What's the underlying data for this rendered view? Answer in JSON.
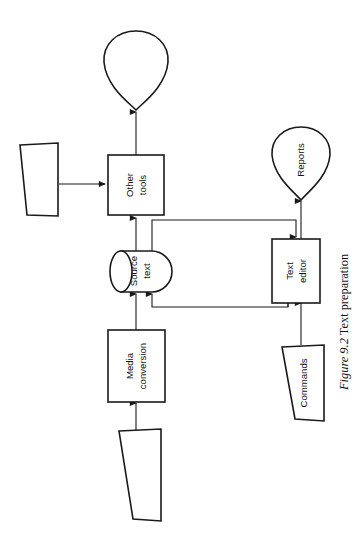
{
  "figure": {
    "caption_prefix": "Figure 9.2",
    "caption_text": "Text preparation",
    "rotation_degrees": -90,
    "background_color": "#ffffff",
    "line_color": "#1a1a1a"
  },
  "nodes": {
    "printed_output": {
      "label": "",
      "shape": "shield"
    },
    "other_tools": {
      "label_line1": "Other",
      "label_line2": "tools",
      "shape": "process-box"
    },
    "manual_input_tools": {
      "label": "",
      "shape": "trapezoid"
    },
    "source_text": {
      "label_line1": "Source",
      "label_line2": "text",
      "shape": "cylinder"
    },
    "media_conversion": {
      "label_line1": "Media",
      "label_line2": "conversion",
      "shape": "process-box"
    },
    "media_input": {
      "label": "",
      "shape": "trapezoid"
    },
    "text_editor": {
      "label_line1": "Text",
      "label_line2": "editor",
      "shape": "process-box"
    },
    "reports": {
      "label": "Reports",
      "shape": "shield"
    },
    "commands": {
      "label": "Commands",
      "shape": "trapezoid"
    }
  },
  "edges": [
    {
      "from": "media_input",
      "to": "media_conversion"
    },
    {
      "from": "media_conversion",
      "to": "source_text"
    },
    {
      "from": "source_text",
      "to": "other_tools"
    },
    {
      "from": "other_tools",
      "to": "printed_output"
    },
    {
      "from": "manual_input_tools",
      "to": "other_tools"
    },
    {
      "from": "source_text",
      "to": "text_editor"
    },
    {
      "from": "text_editor",
      "to": "source_text"
    },
    {
      "from": "commands",
      "to": "text_editor"
    },
    {
      "from": "text_editor",
      "to": "reports"
    }
  ]
}
